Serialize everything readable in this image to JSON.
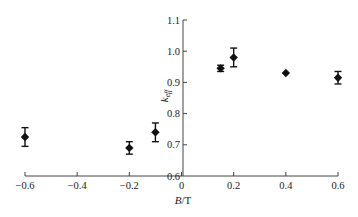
{
  "chart_data": {
    "type": "scatter",
    "title": "",
    "xlabel": "B/T",
    "xlabel_italic": "B",
    "xlabel_unit": "/T",
    "ylabel": "k_eff",
    "ylabel_main": "k",
    "ylabel_sub": "eff",
    "xlim": [
      -0.6,
      0.6
    ],
    "ylim": [
      0.6,
      1.1
    ],
    "xticks": [
      -0.6,
      -0.4,
      -0.2,
      0,
      0.2,
      0.4,
      0.6
    ],
    "xtick_labels": [
      "−0.6",
      "−0.4",
      "−0.2",
      "0",
      "0.2",
      "0.4",
      "0.6"
    ],
    "yticks": [
      0.6,
      0.7,
      0.8,
      0.9,
      1.0,
      1.1
    ],
    "ytick_labels": [
      "0.6",
      "0.7",
      "0.8",
      "0.9",
      "1.0",
      "1.1"
    ],
    "grid": false,
    "legend": "none",
    "marker": "diamond",
    "marker_color": "#111111",
    "series": [
      {
        "name": "k_eff",
        "points": [
          {
            "x": -0.6,
            "y": 0.725,
            "err": 0.03
          },
          {
            "x": -0.2,
            "y": 0.69,
            "err": 0.02
          },
          {
            "x": -0.1,
            "y": 0.74,
            "err": 0.03
          },
          {
            "x": 0.15,
            "y": 0.945,
            "err": 0.01
          },
          {
            "x": 0.2,
            "y": 0.98,
            "err": 0.03
          },
          {
            "x": 0.4,
            "y": 0.93,
            "err": 0.004
          },
          {
            "x": 0.6,
            "y": 0.915,
            "err": 0.02
          }
        ]
      }
    ]
  }
}
